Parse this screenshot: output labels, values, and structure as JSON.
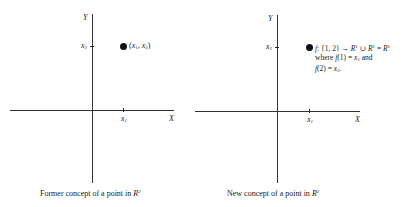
{
  "left_figure": {
    "axis_labels": {
      "y": "Y",
      "x": "X"
    },
    "ticks": {
      "x_tick": "x",
      "x_tick_sub": "1",
      "y_tick": "x",
      "y_tick_sub": "2"
    },
    "point_label": {
      "open": "(",
      "a": "x",
      "a_sub": "1",
      "sep": ", ",
      "b": "x",
      "b_sub": "2",
      "close": ")"
    },
    "caption": {
      "text": "Former concept of a point in ",
      "symbol": "R",
      "sup": "2"
    }
  },
  "right_figure": {
    "axis_labels": {
      "y": "Y",
      "x": "X"
    },
    "ticks": {
      "x_tick": "x",
      "x_tick_sub": "1",
      "y_tick": "x",
      "y_tick_sub": "2"
    },
    "annotation": {
      "line1": {
        "f": "f",
        "mid": ": {1, 2} → ",
        "r1": "R",
        "r1_sup": "1",
        "cup": " ∪ ",
        "r2": "R",
        "r2_sup": "1",
        "eq": " = ",
        "r3": "R",
        "r3_sup": "1"
      },
      "line2": {
        "where": "where ",
        "f1": "f",
        "arg1": "(1) = ",
        "x": "x",
        "x_sub": "1",
        "and": " and"
      },
      "line3": {
        "f2": "f",
        "arg2": "(2) = ",
        "x": "x",
        "x_sub": "2",
        "end": "."
      }
    },
    "caption": {
      "text": "New concept of a point in ",
      "symbol": "R",
      "sup": "2"
    }
  }
}
